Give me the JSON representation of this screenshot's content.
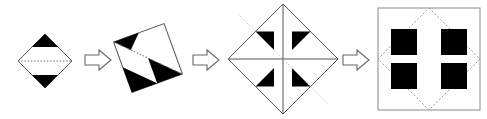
{
  "diagram": {
    "type": "geometric-sequence",
    "width": 487,
    "height": 119,
    "background_color": "#ffffff",
    "fill_black": "#000000",
    "outline_color": "#555555",
    "dotted_color": "#777777",
    "arrow_outline_color": "#666666",
    "arrow_fill": "#ffffff",
    "steps": [
      {
        "index": 1,
        "name": "step-1-diamond-two-triangles",
        "label": "Diamond with horizontal fold line and two black triangles",
        "shape": "diamond",
        "center_x": 45,
        "center_y": 61,
        "half_width": 27,
        "half_height": 27,
        "rotation_deg": 0,
        "fold_line": "horizontal-dotted",
        "black_triangle_count": 2,
        "black_triangle_positions": [
          "top",
          "bottom"
        ]
      },
      {
        "index": 2,
        "name": "step-2-rotated-diamond-three-triangles",
        "label": "Rotated diamond with fold line and three black triangles",
        "shape": "diamond",
        "center_x": 148,
        "center_y": 58,
        "half_width": 38,
        "half_height": 38,
        "rotation_deg": 25,
        "fold_line": "horizontal-dotted",
        "black_triangle_count": 3,
        "black_triangle_positions": [
          "left",
          "right-inner",
          "bottom"
        ]
      },
      {
        "index": 3,
        "name": "step-3-diamond-cross-four-triangles",
        "label": "Diamond with cross fold lines and four black corner triangles",
        "shape": "diamond",
        "center_x": 283,
        "center_y": 59,
        "half_width": 55,
        "half_height": 55,
        "rotation_deg": 0,
        "fold_line": "cross",
        "black_triangle_count": 4,
        "black_triangle_positions": [
          "top-left",
          "top-right",
          "bottom-left",
          "bottom-right"
        ]
      },
      {
        "index": 4,
        "name": "step-4-square-with-four-black-squares",
        "label": "Unfolded square with dotted diamond and four black squares",
        "shape": "square",
        "center_x": 429,
        "center_y": 59,
        "half_size": 51,
        "rotation_deg": 0,
        "fold_line": "dotted-diamond",
        "black_square_count": 4,
        "black_square_positions": [
          "top-left",
          "top-right",
          "bottom-left",
          "bottom-right"
        ]
      }
    ],
    "arrows": [
      {
        "index": 1,
        "name": "arrow-step1-to-step2",
        "direction": "right",
        "x": 84,
        "y": 48,
        "width": 28,
        "height": 24
      },
      {
        "index": 2,
        "name": "arrow-step2-to-step3",
        "direction": "right",
        "x": 192,
        "y": 48,
        "width": 28,
        "height": 24
      },
      {
        "index": 3,
        "name": "arrow-step3-to-step4",
        "direction": "right",
        "x": 342,
        "y": 48,
        "width": 28,
        "height": 24
      }
    ]
  }
}
